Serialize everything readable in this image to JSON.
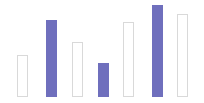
{
  "chart_data": {
    "type": "bar",
    "title": "",
    "subtitle": "",
    "xlabel": "",
    "ylabel": "",
    "grid": false,
    "legend": null,
    "legend_position": "none",
    "axis_visible": false,
    "tick_labels_visible": false,
    "categories": [
      "1",
      "2",
      "3",
      "4",
      "5",
      "6",
      "7"
    ],
    "values": [
      42,
      77,
      55,
      34,
      75,
      92,
      83
    ],
    "ylim": [
      0,
      97
    ],
    "xlim": [
      0,
      204
    ],
    "bar_styles": [
      "hollow",
      "filled",
      "hollow",
      "filled",
      "hollow",
      "filled",
      "hollow"
    ],
    "series": [
      {
        "name": "series-1",
        "values": [
          42,
          77,
          55,
          34,
          75,
          92,
          83
        ]
      }
    ],
    "bars": [
      {
        "category": "1",
        "value": 42,
        "style": "hollow",
        "x": 17,
        "width": 11,
        "top": 55
      },
      {
        "category": "2",
        "value": 77,
        "style": "filled",
        "x": 46,
        "width": 11,
        "top": 20
      },
      {
        "category": "3",
        "value": 55,
        "style": "hollow",
        "x": 72,
        "width": 11,
        "top": 42
      },
      {
        "category": "4",
        "value": 34,
        "style": "filled",
        "x": 98,
        "width": 11,
        "top": 63
      },
      {
        "category": "5",
        "value": 75,
        "style": "hollow",
        "x": 123,
        "width": 11,
        "top": 22
      },
      {
        "category": "6",
        "value": 92,
        "style": "filled",
        "x": 152,
        "width": 11,
        "top": 5
      },
      {
        "category": "7",
        "value": 83,
        "style": "hollow",
        "x": 177,
        "width": 11,
        "top": 14
      }
    ],
    "colors": {
      "background": "#ffffff",
      "bar_fill": "#6f6fbd",
      "bar_outline": "#d9d9d9",
      "baseline": "#ffffff"
    }
  }
}
